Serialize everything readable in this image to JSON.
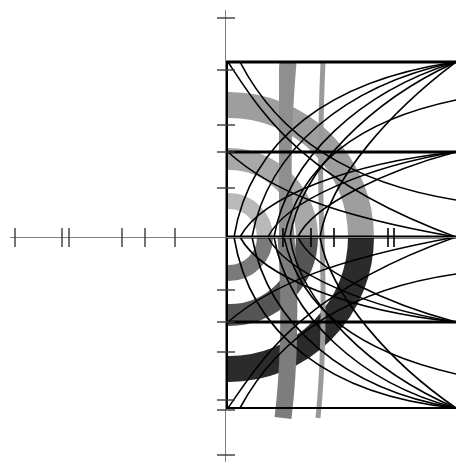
{
  "figure": {
    "title": "",
    "background_color": "#ffffff",
    "width": 456,
    "height": 469
  },
  "chart_data": {
    "type": "line",
    "title": "",
    "subtitle": "",
    "xlabel": "",
    "ylabel": "",
    "xlim": [
      -225,
      231
    ],
    "ylim": [
      -232,
      237
    ],
    "grid": false,
    "legend_position": "none",
    "axes": {
      "origin_px": {
        "x": 225,
        "y": 237
      },
      "x_axis": {
        "color": "#808080",
        "line_width": 1,
        "start_px": 10,
        "end_px": 456,
        "tick_half_length": 9,
        "tick_color": "#3a3a3a",
        "ticks_px": [
          15,
          62,
          69,
          122,
          145,
          175,
          283,
          311,
          334,
          388,
          394
        ]
      },
      "y_axis": {
        "color": "#808080",
        "line_width": 1,
        "start_px": 10,
        "end_px": 462,
        "tick_half_length": 9,
        "tick_color": "#3a3a3a",
        "ticks_px": [
          18,
          62,
          125,
          152,
          188,
          290,
          322,
          352,
          400,
          410,
          455
        ]
      }
    },
    "horizontal_rules": [
      {
        "y_px": 62,
        "x0_px": 225,
        "x1_px": 456,
        "color": "#000000",
        "width": 3
      },
      {
        "y_px": 152,
        "x0_px": 225,
        "x1_px": 456,
        "color": "#000000",
        "width": 3
      },
      {
        "y_px": 237,
        "x0_px": 225,
        "x1_px": 456,
        "color": "#000000",
        "width": 3
      },
      {
        "y_px": 322,
        "x0_px": 225,
        "x1_px": 456,
        "color": "#000000",
        "width": 3
      },
      {
        "y_px": 408,
        "x0_px": 225,
        "x1_px": 456,
        "color": "#000000",
        "width": 2
      }
    ],
    "vertical_rules": [
      {
        "x_px": 226,
        "y0_px": 62,
        "y1_px": 408,
        "color": "#000000",
        "width": 3
      }
    ],
    "arc_bands": {
      "center_px": {
        "x": 229,
        "y": 237
      },
      "note": "Concentric annular bands; upper half rendered in light gray fading out, lower half in dark gray to black.",
      "upper": [
        {
          "radius_px": 36,
          "thickness_px": 16,
          "color": "#b9b9b9"
        },
        {
          "radius_px": 78,
          "thickness_px": 22,
          "color": "#a8a8a8"
        },
        {
          "radius_px": 132,
          "thickness_px": 26,
          "color": "#9e9e9e"
        }
      ],
      "lower": [
        {
          "radius_px": 36,
          "thickness_px": 16,
          "color": "#7a7a7a"
        },
        {
          "radius_px": 78,
          "thickness_px": 22,
          "color": "#555555"
        },
        {
          "radius_px": 132,
          "thickness_px": 26,
          "color": "#2b2b2b"
        }
      ]
    },
    "vertical_bands": [
      {
        "x_center_px": 290,
        "width_px": 17,
        "color": "#8f8f8f",
        "y0_px": 62,
        "y1_px": 237,
        "label": "upper-band-1"
      },
      {
        "x_center_px": 290,
        "width_px": 17,
        "color": "#7d7d7d",
        "y0_px": 237,
        "y1_px": 418,
        "label": "lower-band-1"
      },
      {
        "x_center_px": 322,
        "width_px": 5,
        "color": "#9a9a9a",
        "y0_px": 62,
        "y1_px": 418,
        "label": "band-2"
      }
    ],
    "curve_family": {
      "count": 6,
      "color": "#000000",
      "line_width": 1.6,
      "apex_x_px": [
        234,
        252,
        274,
        300,
        328,
        356
      ],
      "converge_x_px": 456,
      "converge_y_px": [
        62,
        152,
        237,
        322,
        408
      ],
      "description": "Nested leftward-opening parabolic arcs; each arc emanates from the right edge, reaches a leftmost apex, then returns to the right edge."
    }
  }
}
